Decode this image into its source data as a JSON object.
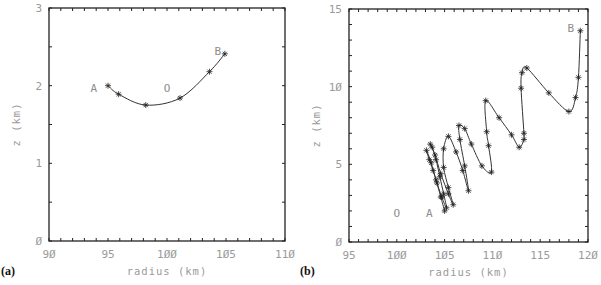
{
  "chart_data": [
    {
      "id": "a",
      "type": "line",
      "panel_label": "(a)",
      "xlabel": "radius (km)",
      "ylabel": "z (km)",
      "xlim": [
        90,
        110
      ],
      "ylim": [
        0,
        3
      ],
      "xticks": [
        90,
        95,
        100,
        105,
        110
      ],
      "xtick_labels": [
        "90",
        "95",
        "100",
        "105",
        "110"
      ],
      "yticks": [
        0,
        1,
        2,
        3
      ],
      "ytick_labels": [
        "0",
        "1",
        "2",
        "3"
      ],
      "x_minor_step": 1,
      "y_minor_step": 0.5,
      "grid": false,
      "series": [
        {
          "name": "trajectory",
          "marker": "asterisk",
          "x": [
            95.0,
            95.9,
            98.2,
            101.1,
            103.6,
            104.9
          ],
          "y": [
            2.0,
            1.89,
            1.75,
            1.84,
            2.18,
            2.41
          ]
        }
      ],
      "annotations": [
        {
          "text": "A",
          "x": 93.8,
          "y": 1.97
        },
        {
          "text": "O",
          "x": 100.0,
          "y": 1.97
        },
        {
          "text": "B",
          "x": 104.3,
          "y": 2.45
        }
      ]
    },
    {
      "id": "b",
      "type": "line",
      "panel_label": "(b)",
      "xlabel": "radius (km)",
      "ylabel": "z (km)",
      "xlim": [
        95,
        120
      ],
      "ylim": [
        0,
        15
      ],
      "xticks": [
        95,
        100,
        105,
        110,
        115,
        120
      ],
      "xtick_labels": [
        "95",
        "100",
        "105",
        "110",
        "115",
        "120"
      ],
      "yticks": [
        0,
        5,
        10,
        15
      ],
      "ytick_labels": [
        "0",
        "5",
        "10",
        "15"
      ],
      "x_minor_step": 1,
      "y_minor_step": 1,
      "grid": false,
      "series": [
        {
          "name": "trajectory",
          "marker": "asterisk",
          "x": [
            105.0,
            104.6,
            104.2,
            103.8,
            103.4,
            103.1,
            103.6,
            104.1,
            104.7,
            105.2,
            104.9,
            104.5,
            104.1,
            103.7,
            103.5,
            104.0,
            104.6,
            105.4,
            105.9,
            105.4,
            104.9,
            104.9,
            105.4,
            106.2,
            106.9,
            107.5,
            107.1,
            106.6,
            106.5,
            107.1,
            107.8,
            108.9,
            109.9,
            109.6,
            109.4,
            109.3,
            110.7,
            112.0,
            112.8,
            113.3,
            113.3,
            113.0,
            113.1,
            113.6,
            115.9,
            118.0,
            118.7,
            119.0,
            119.2
          ],
          "y": [
            2.0,
            2.9,
            3.8,
            4.6,
            5.3,
            5.9,
            5.1,
            4.0,
            2.9,
            2.2,
            3.1,
            4.2,
            5.3,
            6.1,
            6.3,
            5.6,
            4.4,
            3.1,
            2.4,
            3.5,
            4.8,
            6.0,
            6.8,
            5.8,
            4.6,
            3.3,
            4.9,
            6.6,
            7.5,
            7.3,
            6.3,
            4.9,
            4.5,
            6.2,
            7.1,
            9.1,
            8.0,
            6.9,
            6.1,
            6.6,
            7.0,
            9.9,
            10.9,
            11.2,
            9.6,
            8.4,
            9.3,
            10.6,
            13.6
          ]
        }
      ],
      "annotations": [
        {
          "text": "O",
          "x": 100.0,
          "y": 1.85
        },
        {
          "text": "A",
          "x": 103.4,
          "y": 1.85
        },
        {
          "text": "B",
          "x": 118.2,
          "y": 13.75
        }
      ]
    }
  ]
}
